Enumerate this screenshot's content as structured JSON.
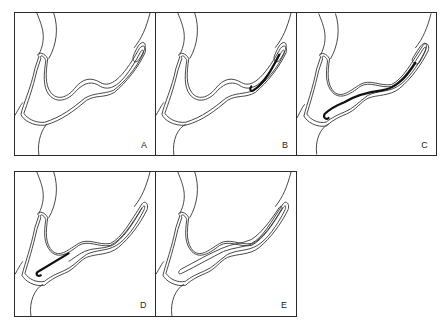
{
  "figure": {
    "type": "sequential-schematic",
    "stroke_color": "#333333",
    "wire_color": "#111111",
    "background": "#ffffff",
    "panels": [
      {
        "id": "A",
        "label": "A",
        "x": 14,
        "y": 12,
        "w": 141,
        "h": 143,
        "catheter": "curved",
        "wire": "none"
      },
      {
        "id": "B",
        "label": "B",
        "x": 155,
        "y": 12,
        "w": 141,
        "h": 143,
        "catheter": "curved",
        "wire": "tip"
      },
      {
        "id": "C",
        "label": "C",
        "x": 296,
        "y": 12,
        "w": 141,
        "h": 143,
        "catheter": "straight",
        "wire": "full"
      },
      {
        "id": "D",
        "label": "D",
        "x": 14,
        "y": 171,
        "w": 141,
        "h": 145,
        "catheter": "straight",
        "wire": "lower"
      },
      {
        "id": "E",
        "label": "E",
        "x": 155,
        "y": 171,
        "w": 141,
        "h": 145,
        "catheter": "straight",
        "wire": "none"
      }
    ]
  }
}
